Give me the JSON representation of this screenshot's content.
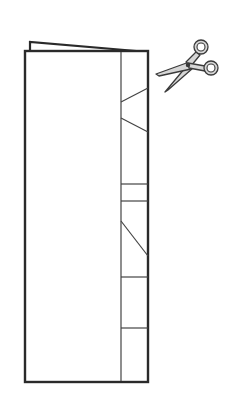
{
  "diagram": {
    "colors": {
      "background": "#ffffff",
      "outline": "#2a2a2a",
      "thin_line": "#444444",
      "scissors_fill": "#d6d6d6",
      "scissors_stroke": "#3a3a3a"
    },
    "booklet": {
      "front": {
        "x1": 25,
        "y1": 50,
        "x2": 148,
        "y2": 382
      },
      "back_top": [
        [
          30,
          50
        ],
        [
          30,
          42
        ],
        [
          148,
          52
        ]
      ],
      "fold_line_x": 121
    },
    "cut_lines": [
      {
        "type": "diagonal",
        "x1": 121,
        "y1": 102,
        "x2": 148,
        "y2": 88
      },
      {
        "type": "diagonal",
        "x1": 121,
        "y1": 118,
        "x2": 148,
        "y2": 132
      },
      {
        "type": "horizontal",
        "x1": 121,
        "y1": 184,
        "x2": 148,
        "y2": 184
      },
      {
        "type": "horizontal",
        "x1": 121,
        "y1": 201,
        "x2": 148,
        "y2": 201
      },
      {
        "type": "diagonal",
        "x1": 121,
        "y1": 221,
        "x2": 148,
        "y2": 256
      },
      {
        "type": "horizontal",
        "x1": 121,
        "y1": 277,
        "x2": 148,
        "y2": 277
      },
      {
        "type": "horizontal",
        "x1": 121,
        "y1": 328,
        "x2": 148,
        "y2": 328
      }
    ],
    "scissors": {
      "icon": "scissors-icon",
      "ring_top": {
        "cx": 201,
        "cy": 47,
        "r": 6
      },
      "ring_bottom": {
        "cx": 211,
        "cy": 68,
        "r": 6
      },
      "pivot": {
        "cx": 187,
        "cy": 64
      }
    }
  }
}
